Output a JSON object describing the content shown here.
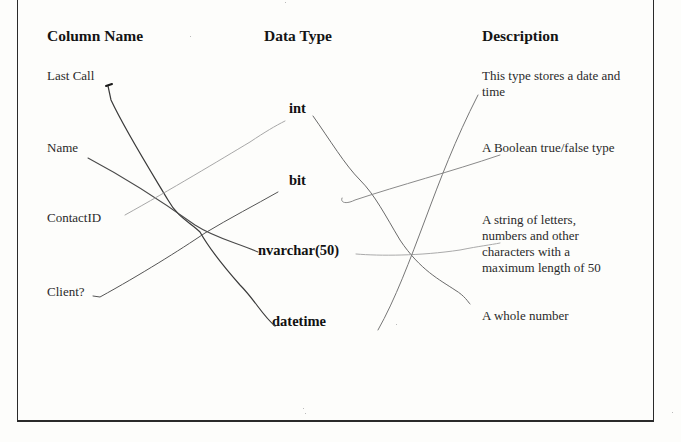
{
  "headers": {
    "column_name": "Column Name",
    "data_type": "Data Type",
    "description": "Description"
  },
  "column_names": [
    "Last Call",
    "Name",
    "ContactID",
    "Client?"
  ],
  "data_types": [
    "int",
    "bit",
    "nvarchar(50)",
    "datetime"
  ],
  "descriptions": [
    "This type stores a date and time",
    "A Boolean true/false type",
    "A string of letters, numbers and other characters with a maximum length of 50",
    "A whole number"
  ],
  "matches": [
    {
      "from": "Last Call",
      "to": "datetime"
    },
    {
      "from": "Name",
      "to": "nvarchar(50)"
    },
    {
      "from": "ContactID",
      "to": "int"
    },
    {
      "from": "Client?",
      "to": "bit"
    },
    {
      "from": "int",
      "to": "A whole number"
    },
    {
      "from": "bit",
      "to": "A Boolean true/false type"
    },
    {
      "from": "nvarchar(50)",
      "to": "A string of letters, numbers and other characters with a maximum length of 50"
    },
    {
      "from": "datetime",
      "to": "This type stores a date and time"
    }
  ],
  "colors": {
    "ink_dark": "#3a3a3a",
    "ink_light": "#9a9a9a",
    "border": "#2a2a2a"
  }
}
